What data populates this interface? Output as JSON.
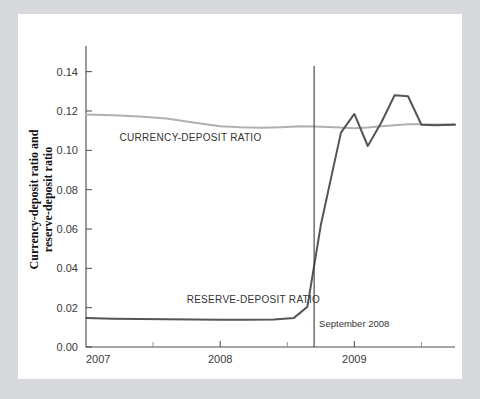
{
  "chart_data": {
    "type": "line",
    "title": "",
    "xlabel": "Year",
    "ylabel": "Currency-deposit ratio and reserve-deposit ratio",
    "xlim": [
      2007.0,
      2009.75
    ],
    "ylim": [
      0.0,
      0.15
    ],
    "grid": false,
    "legend_position": "inline-annotation",
    "y_ticks": [
      "0.00",
      "0.02",
      "0.04",
      "0.06",
      "0.08",
      "0.10",
      "0.12",
      "0.14"
    ],
    "y_tick_values": [
      0.0,
      0.02,
      0.04,
      0.06,
      0.08,
      0.1,
      0.12,
      0.14
    ],
    "x_ticks": [
      "2007",
      "2008",
      "2009"
    ],
    "x_tick_values": [
      2007,
      2008,
      2009
    ],
    "x_minor_tick_values": [
      2007.5,
      2008.5,
      2009.5
    ],
    "annotations": [
      {
        "name": "september-2008-marker",
        "text": "September 2008",
        "x": 2008.7,
        "type": "vertical-line"
      }
    ],
    "series": [
      {
        "name": "CURRENCY-DEPOSIT RATIO",
        "color": "#b0b0b0",
        "label_x": 2007.25,
        "label_y": 0.1045,
        "x": [
          2007.0,
          2007.2,
          2007.4,
          2007.6,
          2007.8,
          2008.0,
          2008.15,
          2008.3,
          2008.45,
          2008.6,
          2008.7,
          2008.85,
          2009.0,
          2009.1,
          2009.2,
          2009.3,
          2009.4,
          2009.5,
          2009.6,
          2009.75
        ],
        "values": [
          0.1182,
          0.1178,
          0.1172,
          0.1162,
          0.1142,
          0.1122,
          0.1117,
          0.1115,
          0.1118,
          0.1122,
          0.1121,
          0.1118,
          0.1112,
          0.1116,
          0.1122,
          0.1127,
          0.1132,
          0.1133,
          0.1131,
          0.1133
        ]
      },
      {
        "name": "RESERVE-DEPOSIT RATIO",
        "color": "#555555",
        "label_x": 2007.75,
        "label_y": 0.0222,
        "x": [
          2007.0,
          2007.2,
          2007.4,
          2007.6,
          2007.8,
          2008.0,
          2008.2,
          2008.4,
          2008.55,
          2008.65,
          2008.75,
          2008.9,
          2009.0,
          2009.1,
          2009.2,
          2009.3,
          2009.4,
          2009.5,
          2009.6,
          2009.75
        ],
        "values": [
          0.0148,
          0.0144,
          0.0142,
          0.0141,
          0.014,
          0.0139,
          0.0138,
          0.014,
          0.0148,
          0.0205,
          0.062,
          0.109,
          0.1185,
          0.1022,
          0.114,
          0.128,
          0.1275,
          0.113,
          0.1128,
          0.113
        ]
      }
    ]
  }
}
